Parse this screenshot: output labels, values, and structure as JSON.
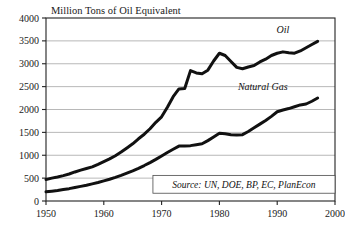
{
  "chart_data": {
    "type": "line",
    "title": "Million Tons of Oil Equivalent",
    "xlabel": "",
    "ylabel": "",
    "xlim": [
      1950,
      2000
    ],
    "ylim": [
      0,
      4000
    ],
    "ytick_step": 500,
    "xtick_step": 10,
    "grid": "horizontal",
    "legend_position": "inline-right",
    "source_note": "Source: UN, DOE, BP, EC, PlanEcon",
    "xticks": [
      "1950",
      "1960",
      "1970",
      "1980",
      "1990",
      "2000"
    ],
    "yticks": [
      "0",
      "500",
      "1000",
      "1500",
      "2000",
      "2500",
      "3000",
      "3500",
      "4000"
    ],
    "series": [
      {
        "name": "Oil",
        "label": "Oil",
        "color": "#111111",
        "x": [
          1950,
          1951,
          1952,
          1953,
          1954,
          1955,
          1956,
          1957,
          1958,
          1959,
          1960,
          1961,
          1962,
          1963,
          1964,
          1965,
          1966,
          1967,
          1968,
          1969,
          1970,
          1971,
          1972,
          1973,
          1974,
          1975,
          1976,
          1977,
          1978,
          1979,
          1980,
          1981,
          1982,
          1983,
          1984,
          1985,
          1986,
          1987,
          1988,
          1989,
          1990,
          1991,
          1992,
          1993,
          1994,
          1995,
          1996,
          1997
        ],
        "values": [
          470,
          500,
          525,
          555,
          590,
          635,
          675,
          710,
          745,
          800,
          860,
          920,
          990,
          1070,
          1160,
          1250,
          1360,
          1460,
          1580,
          1720,
          1840,
          2050,
          2280,
          2450,
          2460,
          2850,
          2800,
          2780,
          2860,
          3060,
          3230,
          3180,
          3050,
          2920,
          2890,
          2930,
          2960,
          3040,
          3100,
          3180,
          3230,
          3260,
          3240,
          3230,
          3280,
          3350,
          3420,
          3490
        ]
      },
      {
        "name": "Natural Gas",
        "label": "Natural Gas",
        "color": "#111111",
        "x": [
          1950,
          1951,
          1952,
          1953,
          1954,
          1955,
          1956,
          1957,
          1958,
          1959,
          1960,
          1961,
          1962,
          1963,
          1964,
          1965,
          1966,
          1967,
          1968,
          1969,
          1970,
          1971,
          1972,
          1973,
          1974,
          1975,
          1976,
          1977,
          1978,
          1979,
          1980,
          1981,
          1982,
          1983,
          1984,
          1985,
          1986,
          1987,
          1988,
          1989,
          1990,
          1991,
          1992,
          1993,
          1994,
          1995,
          1996,
          1997
        ],
        "values": [
          200,
          215,
          230,
          250,
          270,
          295,
          320,
          345,
          375,
          405,
          440,
          475,
          515,
          560,
          610,
          660,
          715,
          775,
          840,
          910,
          985,
          1060,
          1130,
          1200,
          1200,
          1210,
          1230,
          1250,
          1320,
          1400,
          1480,
          1470,
          1450,
          1440,
          1450,
          1520,
          1600,
          1680,
          1760,
          1850,
          1950,
          1990,
          2020,
          2060,
          2100,
          2120,
          2180,
          2250
        ]
      }
    ]
  }
}
